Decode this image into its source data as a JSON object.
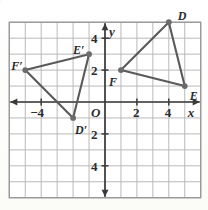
{
  "figure": {
    "kind": "coordinate-plane-triangles",
    "grid": {
      "x_min": -6,
      "x_max": 6,
      "y_min": -6,
      "y_max": 5,
      "cell": 1,
      "grid_color": "#b9b9b9",
      "axis_color": "#3a3a3a",
      "background": "#ffffff"
    },
    "axes": {
      "x_label": "x",
      "y_label": "y",
      "origin_label": "O",
      "x_ticks": [
        {
          "value": -4,
          "text": "−4"
        },
        {
          "value": 2,
          "text": "2"
        },
        {
          "value": 4,
          "text": "4"
        }
      ],
      "y_ticks": [
        {
          "value": 4,
          "text": "4"
        },
        {
          "value": 2,
          "text": "2"
        },
        {
          "value": -2,
          "text": "2"
        },
        {
          "value": -4,
          "text": "4"
        }
      ]
    },
    "shape_color": "#5a5a5a",
    "point_color": "#6b6b6b",
    "triangles": [
      {
        "name": "DEF",
        "vertices": [
          {
            "label": "D",
            "x": 4,
            "y": 5,
            "label_dx": 9,
            "label_dy": -12
          },
          {
            "label": "E",
            "x": 5,
            "y": 1,
            "label_dx": 5,
            "label_dy": 4
          },
          {
            "label": "F",
            "x": 1,
            "y": 2,
            "label_dx": -12,
            "label_dy": 6
          }
        ]
      },
      {
        "name": "D'E'F'",
        "vertices": [
          {
            "label": "D′",
            "x": -2,
            "y": -1,
            "label_dx": 2,
            "label_dy": 6
          },
          {
            "label": "E′",
            "x": -1,
            "y": 3,
            "label_dx": -16,
            "label_dy": -10
          },
          {
            "label": "F′",
            "x": -5,
            "y": 2,
            "label_dx": -14,
            "label_dy": -10
          }
        ]
      }
    ]
  },
  "chart_data": {
    "type": "scatter",
    "title": "",
    "xlabel": "x",
    "ylabel": "y",
    "xlim": [
      -6,
      6
    ],
    "ylim": [
      -6,
      5
    ],
    "grid": true,
    "legend": "none",
    "series": [
      {
        "name": "Triangle DEF",
        "points": [
          {
            "label": "D",
            "x": 4,
            "y": 5
          },
          {
            "label": "E",
            "x": 5,
            "y": 1
          },
          {
            "label": "F",
            "x": 1,
            "y": 2
          }
        ]
      },
      {
        "name": "Triangle D'E'F'",
        "points": [
          {
            "label": "D'",
            "x": -2,
            "y": -1
          },
          {
            "label": "E'",
            "x": -1,
            "y": 3
          },
          {
            "label": "F'",
            "x": -5,
            "y": 2
          }
        ]
      }
    ],
    "annotations": [
      "O",
      "x",
      "y",
      "-4",
      "2",
      "4",
      "2",
      "4",
      "2",
      "4"
    ]
  }
}
